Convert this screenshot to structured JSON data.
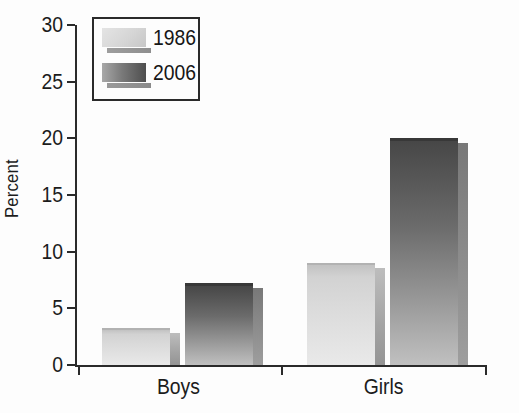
{
  "chart_data": {
    "type": "bar",
    "title": "",
    "xlabel": "",
    "ylabel": "Percent",
    "categories": [
      "Boys",
      "Girls"
    ],
    "series": [
      {
        "name": "1986",
        "values": [
          3.3,
          9.0
        ]
      },
      {
        "name": "2006",
        "values": [
          7.2,
          20.0
        ]
      }
    ],
    "ylim": [
      0,
      30
    ],
    "yticks": [
      0,
      5,
      10,
      15,
      20,
      25,
      30
    ],
    "grid": false,
    "legend_position": "top-left",
    "colors": {
      "bar_1986_top": "#c2c2c2",
      "bar_1986_bottom": "#e9e9e9",
      "bar_2006_top": "#474747",
      "bar_2006_bottom": "#c0c0c0",
      "bar_shadow": "#9e9e9e",
      "axis": "#2a2a2a",
      "text": "#1c1c1c",
      "background": "#fdfdfd"
    }
  },
  "legend": {
    "items": [
      {
        "label": "1986"
      },
      {
        "label": "2006"
      }
    ]
  }
}
